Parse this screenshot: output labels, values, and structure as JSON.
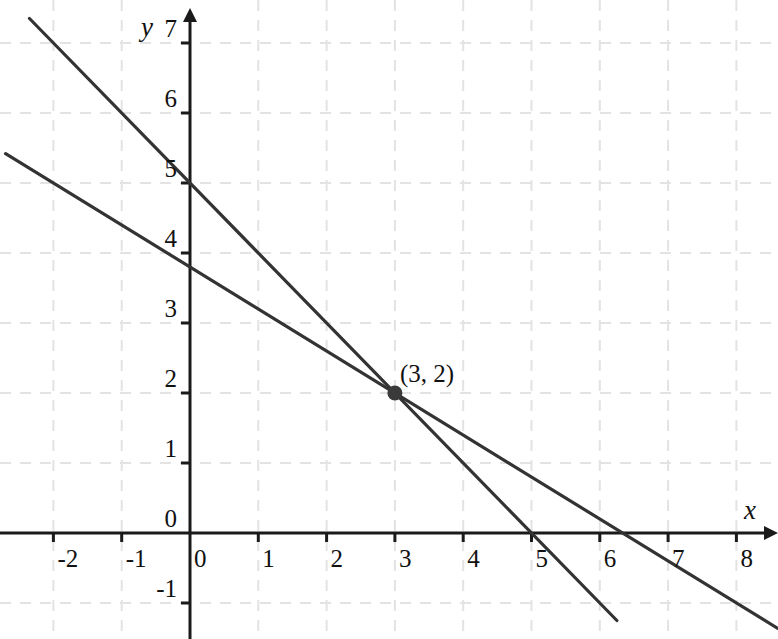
{
  "chart_data": {
    "type": "line",
    "title": "",
    "subtitle": "",
    "xlabel": "x",
    "ylabel": "y",
    "xlim": [
      -2.8,
      8.6
    ],
    "ylim": [
      -1.5,
      7.3
    ],
    "grid": true,
    "grid_color": "#e3e3e3",
    "grid_style": "dashed",
    "axis_color": "#1a1a1a",
    "line_color": "#333333",
    "background": "#ffffff",
    "legend": "none",
    "xticks": [
      -2,
      -1,
      0,
      1,
      2,
      3,
      4,
      5,
      6,
      7,
      8
    ],
    "xtick_labels": [
      "-2",
      "-1",
      "0",
      "1",
      "2",
      "3",
      "4",
      "5",
      "6",
      "7",
      "8"
    ],
    "yticks": [
      -1,
      0,
      1,
      2,
      3,
      4,
      5,
      6,
      7
    ],
    "ytick_labels": [
      "-1",
      "0",
      "1",
      "2",
      "3",
      "4",
      "5",
      "6",
      "7"
    ],
    "series": [
      {
        "name": "line-1",
        "equation": "y = -x + 5",
        "slope": -1,
        "intercept": 5,
        "x_intercept": 5,
        "y_intercept": 5,
        "x_start": -2.35,
        "x_end": 6.25,
        "points": [
          [
            -2.35,
            7.35
          ],
          [
            0,
            5
          ],
          [
            3,
            2
          ],
          [
            5,
            0
          ],
          [
            6.25,
            -1.25
          ]
        ]
      },
      {
        "name": "line-2",
        "equation": "y = -0.6x + 3.8",
        "slope": -0.6,
        "intercept": 3.8,
        "x_intercept": 6.33,
        "y_intercept": 3.8,
        "x_start": -2.7,
        "x_end": 8.6,
        "points": [
          [
            -2.7,
            5.42
          ],
          [
            0,
            3.8
          ],
          [
            3,
            2
          ],
          [
            6.33,
            0
          ],
          [
            8.6,
            -1.36
          ]
        ]
      }
    ],
    "annotations": [
      {
        "name": "intersection-point",
        "label": "(3, 2)",
        "x": 3,
        "y": 2,
        "marker": "filled-circle",
        "marker_color": "#3a3a3a"
      }
    ]
  },
  "axis_names": {
    "x": "x",
    "y": "y"
  }
}
